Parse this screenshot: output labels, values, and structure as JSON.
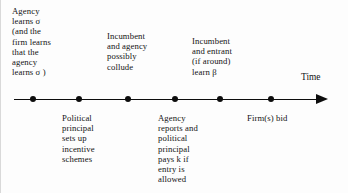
{
  "diagram": {
    "title_label": "Time",
    "axis": {
      "arrow_direction": "right",
      "line_color": "#0d0d0d",
      "start_x": 14,
      "end_x": 328,
      "y": 99
    },
    "events": [
      {
        "id": "event-1",
        "x": 33,
        "position": "above",
        "label": "Agency\nlearns σ\n(and the\nfirm learns\nthat the\nagency\nlearns σ )"
      },
      {
        "id": "event-2",
        "x": 79,
        "position": "below",
        "label": "Political\nprincipal\nsets up\nincentive\nschemes"
      },
      {
        "id": "event-3",
        "x": 128,
        "position": "above",
        "label": "Incumbent\nand agency\npossibly\ncollude"
      },
      {
        "id": "event-4",
        "x": 175,
        "position": "below",
        "label": "Agency\nreports and\npolitical\nprincipal\npays k if\nentry is\nallowed"
      },
      {
        "id": "event-5",
        "x": 220,
        "position": "above",
        "label": "Incumbent\nand entrant\n(if around)\nlearn β"
      },
      {
        "id": "event-6",
        "x": 271,
        "position": "below",
        "label": "Firm(s) bid"
      }
    ]
  }
}
